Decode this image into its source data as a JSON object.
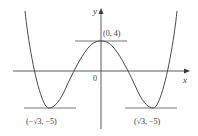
{
  "figure": {
    "type": "function-graph",
    "axes": {
      "x_label": "x",
      "y_label": "y",
      "origin_label": "0"
    },
    "points": [
      {
        "name": "local-max",
        "label": "(0, 4)"
      },
      {
        "name": "left-min",
        "label": "(−√3, −5)"
      },
      {
        "name": "right-min",
        "label": "(√3, −5)"
      }
    ],
    "colors": {
      "curve": "#4a4a4a",
      "axes": "#4a4a4a",
      "tangents": "#6a6a6a",
      "text": "#3a3a3a",
      "background": "#ffffff"
    }
  }
}
